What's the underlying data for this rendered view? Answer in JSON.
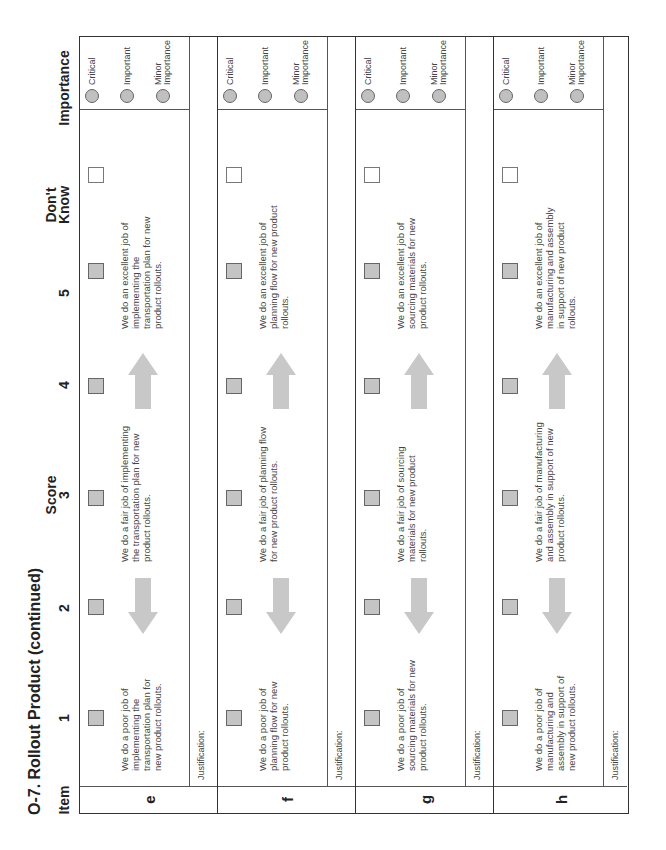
{
  "title": "O-7. Rollout Product (continued)",
  "headers": {
    "item": "Item",
    "score_group": "Score",
    "scores": [
      "1",
      "2",
      "3",
      "4",
      "5"
    ],
    "dont_know_line1": "Don't",
    "dont_know_line2": "Know",
    "importance": "Importance"
  },
  "importance_options": [
    {
      "lines": [
        "Critical"
      ]
    },
    {
      "lines": [
        "Important"
      ]
    },
    {
      "lines": [
        "Minor",
        "Importance"
      ]
    }
  ],
  "justification_label": "Justification:",
  "arrows": {
    "left": "arrow-left-icon",
    "right": "arrow-right-icon"
  },
  "colors": {
    "checkbox_fill": "#c4c4c4",
    "arrow_fill": "#c8c8c8",
    "circle_fill": "#c0c0c0",
    "border": "#333333"
  },
  "rows": [
    {
      "item": "e",
      "poor": "We do a poor job of implementing the transportation plan for new product rollouts.",
      "fair": "We do a fair job of implementing the transportation plan for new product rollouts.",
      "excellent": "We do an excellent job of implementing the transportation plan for new product rollouts."
    },
    {
      "item": "f",
      "poor": "We do a poor job of planning flow for new product rollouts.",
      "fair": "We do a fair job of planning flow for new product rollouts.",
      "excellent": "We do an excellent job of planning flow for new product rollouts."
    },
    {
      "item": "g",
      "poor": "We do a poor job of sourcing materials for new product rollouts.",
      "fair": "We do a fair job of sourcing materials for new product rollouts.",
      "excellent": "We do an excellent job of sourcing materials for new product rollouts."
    },
    {
      "item": "h",
      "poor": "We do a poor job of manufacturing and assembly in support of new product rollouts.",
      "fair": "We do a fair job of manufacturing and assembly in support of new product rollouts.",
      "excellent": "We do an excellent job of manufacturing and assembly in support of new product rollouts."
    }
  ]
}
